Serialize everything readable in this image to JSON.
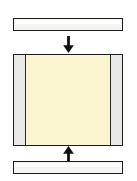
{
  "figure": {
    "name": "compression-loading-diagram",
    "background_color": "#ffffff",
    "title": "",
    "caption": ""
  },
  "top_platen": {
    "name": "top-platen",
    "label": "",
    "fill_color": "#f4f4f2",
    "border_color": "#1c1c1c",
    "x": 13,
    "y": 18,
    "width": 110,
    "height": 13
  },
  "bottom_platen": {
    "name": "bottom-platen",
    "label": "",
    "fill_color": "#f4f4f2",
    "border_color": "#1c1c1c",
    "x": 13,
    "y": 161,
    "width": 110,
    "height": 13
  },
  "specimen": {
    "name": "specimen-assembly",
    "label": "",
    "border_color": "#1c1c1c",
    "x": 13,
    "y": 54,
    "width": 110,
    "height": 92,
    "core": {
      "name": "specimen-core",
      "label": "",
      "fill_color": "#fbf6cf"
    },
    "left_plate": {
      "name": "left-side-plate",
      "label": "",
      "fill_color": "#e9e9e7",
      "width": 11
    },
    "right_plate": {
      "name": "right-side-plate",
      "label": "",
      "fill_color": "#e9e9e7",
      "width": 11
    }
  },
  "arrows": [
    {
      "name": "load-arrow-down",
      "direction": "down",
      "label": "",
      "color": "#111111",
      "x": 62,
      "y": 36
    },
    {
      "name": "load-arrow-up",
      "direction": "up",
      "label": "",
      "color": "#111111",
      "x": 62,
      "y": 146
    }
  ]
}
